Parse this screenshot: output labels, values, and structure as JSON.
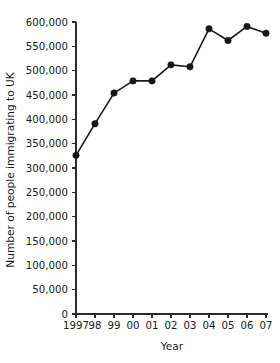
{
  "chart_data": {
    "type": "line",
    "title": "",
    "xlabel": "Year",
    "ylabel": "Number of people immigrating to UK",
    "categories": [
      "1997",
      "98",
      "99",
      "00",
      "01",
      "02",
      "03",
      "04",
      "05",
      "06",
      "07"
    ],
    "x_full_years": [
      1997,
      1998,
      1999,
      2000,
      2001,
      2002,
      2003,
      2004,
      2005,
      2006,
      2007
    ],
    "values": [
      326000,
      391000,
      454000,
      479000,
      479000,
      512000,
      508000,
      586000,
      562000,
      591000,
      577000
    ],
    "series": [
      {
        "name": "Number of people immigrating to UK",
        "values": [
          326000,
          391000,
          454000,
          479000,
          479000,
          512000,
          508000,
          586000,
          562000,
          591000,
          577000
        ]
      }
    ],
    "ylim": [
      0,
      600000
    ],
    "ytick_values": [
      0,
      50000,
      100000,
      150000,
      200000,
      250000,
      300000,
      350000,
      400000,
      450000,
      500000,
      550000,
      600000
    ],
    "ytick_labels": [
      "0",
      "50,000",
      "100,000",
      "150,000",
      "200,000",
      "250,000",
      "300,000",
      "350,000",
      "400,000",
      "450,000",
      "500,000",
      "550,000",
      "600,000"
    ],
    "grid": false,
    "legend": false,
    "legend_position": "none",
    "marker": "filled-circle",
    "line_color": "#1a1a1a",
    "marker_color": "#161616",
    "axis_color": "#2b2b2b",
    "background_color": "#ffffff"
  }
}
